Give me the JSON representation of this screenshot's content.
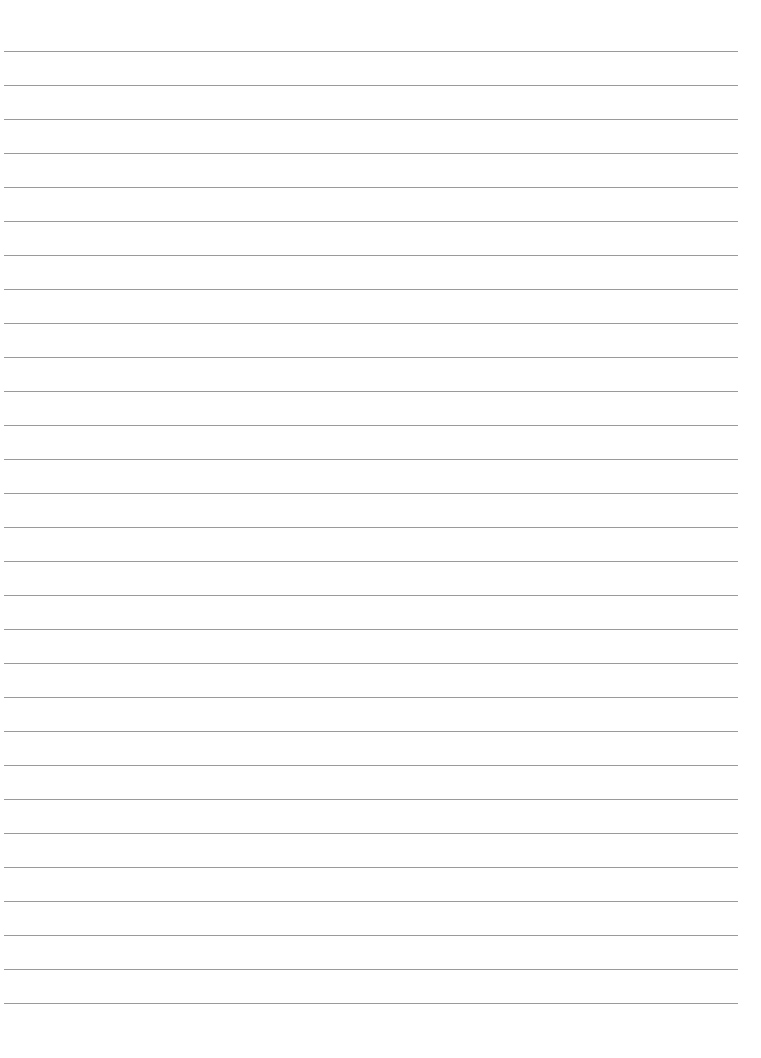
{
  "page": {
    "type": "blank lined paper",
    "line_count": 29,
    "first_line_y": 51,
    "line_spacing": 34,
    "line_color": "#9a9a9a",
    "background_color": "#ffffff",
    "text": ""
  }
}
